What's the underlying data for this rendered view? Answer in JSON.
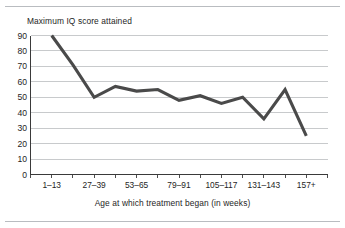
{
  "figure": {
    "title": "Maximum IQ score attained",
    "axis_title": "Age at which treatment began (in weeks)",
    "line_color": "#4a4a4a",
    "grid_color": "#b0b3b7",
    "axis_color": "#3a3a3a",
    "rule_color": "#b9bcc0"
  },
  "chart_data": {
    "type": "line",
    "title": "Maximum IQ score attained",
    "xlabel": "Age at which treatment began (in weeks)",
    "ylabel": "Maximum IQ score attained",
    "grid": true,
    "legend": "none",
    "ylim": [
      0,
      90
    ],
    "yticks": [
      0,
      10,
      20,
      30,
      40,
      50,
      60,
      70,
      80,
      90
    ],
    "ytick_labels": [
      "0",
      "10",
      "20",
      "30",
      "40",
      "50",
      "60",
      "70",
      "80",
      "90"
    ],
    "xtick_labels": [
      "1–13",
      "27–39",
      "53–65",
      "79–91",
      "105–117",
      "131–143",
      "157+"
    ],
    "x_categories": [
      "1–13",
      "14–26",
      "27–39",
      "40–52",
      "53–65",
      "66–78",
      "79–91",
      "92–104",
      "105–117",
      "118–130",
      "131–143",
      "144–156",
      "157+"
    ],
    "series": [
      {
        "name": "Maximum IQ score attained",
        "values": [
          90,
          71,
          50,
          57,
          54,
          55,
          48,
          51,
          46,
          50,
          36,
          55,
          25
        ]
      }
    ]
  }
}
